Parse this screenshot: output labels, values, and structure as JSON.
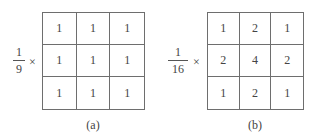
{
  "figure": {
    "panels": [
      {
        "id": "a",
        "caption": "(a)",
        "scale": {
          "numerator": "1",
          "denominator": "9",
          "operator": "×"
        },
        "kernel": [
          [
            "1",
            "1",
            "1"
          ],
          [
            "1",
            "1",
            "1"
          ],
          [
            "1",
            "1",
            "1"
          ]
        ]
      },
      {
        "id": "b",
        "caption": "(b)",
        "scale": {
          "numerator": "1",
          "denominator": "16",
          "operator": "×"
        },
        "kernel": [
          [
            "1",
            "2",
            "1"
          ],
          [
            "2",
            "4",
            "2"
          ],
          [
            "1",
            "2",
            "1"
          ]
        ]
      }
    ]
  }
}
